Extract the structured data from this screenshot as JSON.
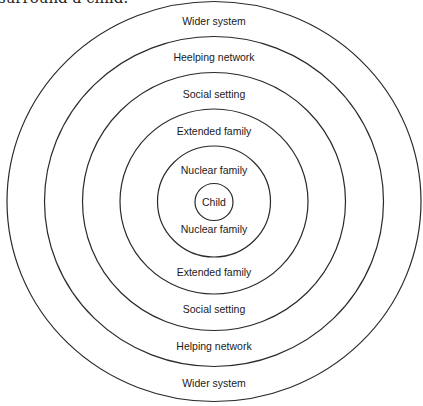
{
  "caption": "surround a child.",
  "diagram": {
    "type": "concentric-circles",
    "center": [
      214,
      201.5
    ],
    "rings": [
      {
        "name": "wider-system",
        "rx": 207,
        "ry": 200
      },
      {
        "name": "helping-network",
        "rx": 169.5,
        "ry": 165
      },
      {
        "name": "social-setting",
        "rx": 131.5,
        "ry": 129
      },
      {
        "name": "extended-family",
        "rx": 94,
        "ry": 92.5
      },
      {
        "name": "nuclear-family",
        "rx": 56.5,
        "ry": 55.5
      },
      {
        "name": "child",
        "rx": 19,
        "ry": 18.5
      }
    ],
    "labels": {
      "wider_top": "Wider system",
      "helping_top": "Heelping network",
      "social_top": "Social setting",
      "extended_top": "Extended family",
      "nuclear_top": "Nuclear family",
      "child": "Child",
      "nuclear_bottom": "Nuclear family",
      "extended_bottom": "Extended family",
      "social_bottom": "Social setting",
      "helping_bottom": "Helping network",
      "wider_bottom": "Wider system"
    }
  }
}
